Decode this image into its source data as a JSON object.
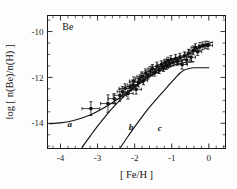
{
  "chart_data": {
    "type": "scatter",
    "title": "",
    "annotation": "Be",
    "xlabel": "[ Fe/H ]",
    "ylabel": "log [ n(Be)/n(H) ]",
    "xlim": [
      -4.35,
      0.45
    ],
    "ylim": [
      -15.1,
      -9.3
    ],
    "xticks": [
      -4,
      -3,
      -2,
      -1,
      0
    ],
    "xticklabels": [
      "-4",
      "-3",
      "-2",
      "-1",
      "0"
    ],
    "yticks": [
      -10,
      -12,
      -14
    ],
    "yticklabels": [
      "-10",
      "-12",
      "-14"
    ],
    "minor_x_per_major": 5,
    "minor_y_per_major": 4,
    "grid": false,
    "legend": "none",
    "tick_direction": "in",
    "frame": "box",
    "series": [
      {
        "name": "Be observations",
        "type": "scatter",
        "marker": "square",
        "errorbars": "xy",
        "points": [
          {
            "x": -3.18,
            "y": -13.36,
            "xerr": 0.24,
            "yerr": 0.3
          },
          {
            "x": -2.72,
            "y": -13.14,
            "xerr": 0.2,
            "yerr": 0.38
          },
          {
            "x": -2.55,
            "y": -12.93,
            "xerr": 0.16,
            "yerr": 0.22
          },
          {
            "x": -2.4,
            "y": -12.78,
            "xerr": 0.18,
            "yerr": 0.26
          },
          {
            "x": -2.33,
            "y": -12.62,
            "xerr": 0.14,
            "yerr": 0.22
          },
          {
            "x": -2.26,
            "y": -12.48,
            "xerr": 0.16,
            "yerr": 0.2
          },
          {
            "x": -2.18,
            "y": -12.7,
            "xerr": 0.14,
            "yerr": 0.24
          },
          {
            "x": -2.12,
            "y": -12.4,
            "xerr": 0.13,
            "yerr": 0.2
          },
          {
            "x": -2.05,
            "y": -12.33,
            "xerr": 0.15,
            "yerr": 0.22
          },
          {
            "x": -2.02,
            "y": -12.16,
            "xerr": 0.12,
            "yerr": 0.18
          },
          {
            "x": -1.96,
            "y": -12.52,
            "xerr": 0.14,
            "yerr": 0.21
          },
          {
            "x": -1.9,
            "y": -12.22,
            "xerr": 0.13,
            "yerr": 0.19
          },
          {
            "x": -1.86,
            "y": -12.06,
            "xerr": 0.12,
            "yerr": 0.17
          },
          {
            "x": -1.8,
            "y": -11.96,
            "xerr": 0.14,
            "yerr": 0.2
          },
          {
            "x": -1.76,
            "y": -12.14,
            "xerr": 0.11,
            "yerr": 0.18
          },
          {
            "x": -1.7,
            "y": -11.82,
            "xerr": 0.13,
            "yerr": 0.19
          },
          {
            "x": -1.64,
            "y": -11.9,
            "xerr": 0.12,
            "yerr": 0.17
          },
          {
            "x": -1.58,
            "y": -11.72,
            "xerr": 0.14,
            "yerr": 0.2
          },
          {
            "x": -1.52,
            "y": -11.62,
            "xerr": 0.12,
            "yerr": 0.18
          },
          {
            "x": -1.46,
            "y": -11.78,
            "xerr": 0.11,
            "yerr": 0.16
          },
          {
            "x": -1.4,
            "y": -11.52,
            "xerr": 0.13,
            "yerr": 0.19
          },
          {
            "x": -1.34,
            "y": -11.66,
            "xerr": 0.12,
            "yerr": 0.17
          },
          {
            "x": -1.28,
            "y": -11.44,
            "xerr": 0.11,
            "yerr": 0.16
          },
          {
            "x": -1.22,
            "y": -11.56,
            "xerr": 0.13,
            "yerr": 0.18
          },
          {
            "x": -1.18,
            "y": -11.36,
            "xerr": 0.1,
            "yerr": 0.15
          },
          {
            "x": -1.14,
            "y": -11.48,
            "xerr": 0.12,
            "yerr": 0.17
          },
          {
            "x": -1.1,
            "y": -11.28,
            "xerr": 0.11,
            "yerr": 0.16
          },
          {
            "x": -1.06,
            "y": -11.4,
            "xerr": 0.1,
            "yerr": 0.15
          },
          {
            "x": -1.02,
            "y": -11.22,
            "xerr": 0.12,
            "yerr": 0.17
          },
          {
            "x": -0.96,
            "y": -11.34,
            "xerr": 0.11,
            "yerr": 0.16
          },
          {
            "x": -0.9,
            "y": -11.18,
            "xerr": 0.13,
            "yerr": 0.18
          },
          {
            "x": -0.84,
            "y": -11.3,
            "xerr": 0.12,
            "yerr": 0.16
          },
          {
            "x": -0.78,
            "y": -11.12,
            "xerr": 0.11,
            "yerr": 0.17
          },
          {
            "x": -0.72,
            "y": -11.44,
            "xerr": 0.14,
            "yerr": 0.2
          },
          {
            "x": -0.66,
            "y": -11.06,
            "xerr": 0.12,
            "yerr": 0.17
          },
          {
            "x": -0.6,
            "y": -11.24,
            "xerr": 0.13,
            "yerr": 0.18
          },
          {
            "x": -0.54,
            "y": -10.94,
            "xerr": 0.11,
            "yerr": 0.16
          },
          {
            "x": -0.48,
            "y": -11.12,
            "xerr": 0.12,
            "yerr": 0.17
          },
          {
            "x": -0.42,
            "y": -10.82,
            "xerr": 0.13,
            "yerr": 0.19
          },
          {
            "x": -0.36,
            "y": -10.7,
            "xerr": 0.12,
            "yerr": 0.17
          },
          {
            "x": -0.3,
            "y": -10.88,
            "xerr": 0.11,
            "yerr": 0.16
          },
          {
            "x": -0.24,
            "y": -10.66,
            "xerr": 0.13,
            "yerr": 0.18
          },
          {
            "x": -0.16,
            "y": -10.62,
            "xerr": 0.12,
            "yerr": 0.17
          },
          {
            "x": -0.08,
            "y": -10.58,
            "xerr": 0.11,
            "yerr": 0.16
          },
          {
            "x": -0.02,
            "y": -10.6,
            "xerr": 0.12,
            "yerr": 0.17
          }
        ]
      }
    ],
    "curves": [
      {
        "name": "a",
        "label": "a",
        "label_x": -3.75,
        "label_y": -14.18,
        "points": [
          {
            "x": -4.3,
            "y": -14.02
          },
          {
            "x": -4.0,
            "y": -13.98
          },
          {
            "x": -3.7,
            "y": -13.9
          },
          {
            "x": -3.4,
            "y": -13.76
          },
          {
            "x": -3.1,
            "y": -13.56
          },
          {
            "x": -2.8,
            "y": -13.3
          },
          {
            "x": -2.5,
            "y": -13.0
          },
          {
            "x": -2.2,
            "y": -12.64
          },
          {
            "x": -1.9,
            "y": -12.26
          },
          {
            "x": -1.6,
            "y": -11.92
          },
          {
            "x": -1.3,
            "y": -11.62
          },
          {
            "x": -1.0,
            "y": -11.36
          },
          {
            "x": -0.7,
            "y": -11.1
          },
          {
            "x": -0.4,
            "y": -10.82
          },
          {
            "x": -0.1,
            "y": -10.58
          },
          {
            "x": 0.1,
            "y": -10.46
          }
        ]
      },
      {
        "name": "b",
        "label": "b",
        "label_x": -2.1,
        "label_y": -14.3,
        "points": [
          {
            "x": -3.42,
            "y": -15.05
          },
          {
            "x": -3.2,
            "y": -14.56
          },
          {
            "x": -3.0,
            "y": -14.12
          },
          {
            "x": -2.8,
            "y": -13.72
          },
          {
            "x": -2.6,
            "y": -13.34
          },
          {
            "x": -2.4,
            "y": -13.0
          },
          {
            "x": -2.2,
            "y": -12.7
          },
          {
            "x": -2.0,
            "y": -12.44
          },
          {
            "x": -1.8,
            "y": -12.2
          },
          {
            "x": -1.6,
            "y": -11.98
          },
          {
            "x": -1.4,
            "y": -11.8
          },
          {
            "x": -1.2,
            "y": -11.64
          },
          {
            "x": -1.0,
            "y": -11.5
          },
          {
            "x": -0.8,
            "y": -11.4
          },
          {
            "x": -0.6,
            "y": -11.34
          },
          {
            "x": -0.4,
            "y": -11.32
          }
        ]
      },
      {
        "name": "c",
        "label": "c",
        "label_x": -1.32,
        "label_y": -14.32,
        "points": [
          {
            "x": -2.38,
            "y": -15.05
          },
          {
            "x": -2.2,
            "y": -14.62
          },
          {
            "x": -2.0,
            "y": -14.16
          },
          {
            "x": -1.8,
            "y": -13.72
          },
          {
            "x": -1.6,
            "y": -13.3
          },
          {
            "x": -1.4,
            "y": -12.92
          },
          {
            "x": -1.2,
            "y": -12.56
          },
          {
            "x": -1.05,
            "y": -12.28
          },
          {
            "x": -0.9,
            "y": -12.02
          },
          {
            "x": -0.78,
            "y": -11.82
          },
          {
            "x": -0.66,
            "y": -11.68
          },
          {
            "x": -0.55,
            "y": -11.62
          },
          {
            "x": -0.4,
            "y": -11.58
          },
          {
            "x": -0.2,
            "y": -11.58
          },
          {
            "x": 0.0,
            "y": -11.58
          }
        ]
      }
    ]
  }
}
